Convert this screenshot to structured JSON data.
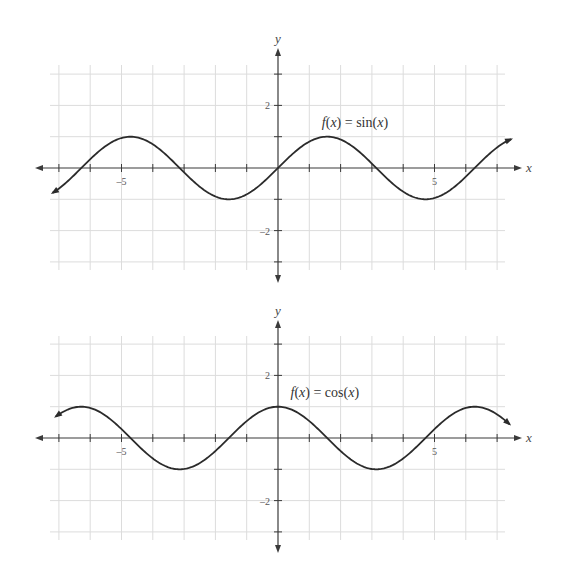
{
  "chart_data": [
    {
      "type": "line",
      "title": "f(x) = sin(x)",
      "function": "sin",
      "xlabel": "x",
      "ylabel": "y",
      "xlim": [
        -7,
        7
      ],
      "ylim": [
        -3,
        3
      ],
      "x_domain_plotted": [
        -7.2,
        7.45
      ],
      "grid": true,
      "x_tick_labels": [
        {
          "value": -5,
          "label": "–5"
        },
        {
          "value": 5,
          "label": "5"
        }
      ],
      "y_tick_labels": [
        {
          "value": 2,
          "label": "2"
        },
        {
          "value": -2,
          "label": "–2"
        }
      ],
      "annotation": {
        "text": "f(x) = sin(x)",
        "x": 1.4,
        "y": 1.3
      },
      "key_points": {
        "x": [
          -6.28,
          -4.71,
          -3.14,
          -1.57,
          0,
          1.57,
          3.14,
          4.71,
          6.28
        ],
        "y": [
          0,
          1,
          0,
          -1,
          0,
          1,
          0,
          -1,
          0
        ]
      },
      "layout": {
        "origin_x": 278,
        "origin_y": 168,
        "unit": 31.3,
        "grid_left": 50,
        "grid_right": 505,
        "grid_top": 65,
        "grid_bottom": 270,
        "axis_left": 35,
        "axis_right": 522,
        "axis_top": 48,
        "axis_bottom": 283
      }
    },
    {
      "type": "line",
      "title": "f(x) = cos(x)",
      "function": "cos",
      "xlabel": "x",
      "ylabel": "y",
      "xlim": [
        -7,
        7
      ],
      "ylim": [
        -3,
        3
      ],
      "x_domain_plotted": [
        -7.1,
        7.4
      ],
      "grid": true,
      "x_tick_labels": [
        {
          "value": -5,
          "label": "–5"
        },
        {
          "value": 5,
          "label": "5"
        }
      ],
      "y_tick_labels": [
        {
          "value": 2,
          "label": "2"
        },
        {
          "value": -2,
          "label": "–2"
        }
      ],
      "annotation": {
        "text": "f(x) = cos(x)",
        "x": 0.4,
        "y": 1.3
      },
      "key_points": {
        "x": [
          -6.28,
          -4.71,
          -3.14,
          -1.57,
          0,
          1.57,
          3.14,
          4.71,
          6.28
        ],
        "y": [
          1,
          0,
          -1,
          0,
          1,
          0,
          -1,
          0,
          1
        ]
      },
      "layout": {
        "origin_x": 278,
        "origin_y": 438,
        "unit": 31.3,
        "grid_left": 50,
        "grid_right": 505,
        "grid_top": 336,
        "grid_bottom": 540,
        "axis_left": 35,
        "axis_right": 522,
        "axis_top": 320,
        "axis_bottom": 553
      }
    }
  ],
  "colors": {
    "grid": "#dcdcdc",
    "axis": "#3a3a3a",
    "curve": "#2b2b2b"
  }
}
